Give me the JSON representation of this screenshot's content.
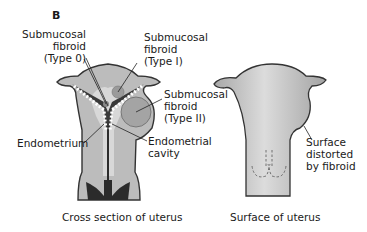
{
  "panel_label": "B",
  "left_figure": {
    "caption": "Cross section of uterus",
    "labels": {
      "type0": "Submucosal\nfibroid\n(Type 0)",
      "type1": "Submucosal\nfibroid\n(Type I)",
      "type2": "Submucosal\nfibroid\n(Type II)",
      "endometrium": "Endometrium",
      "cavity": "Endometrial\ncavity"
    }
  },
  "right_figure": {
    "caption": "Surface of uterus",
    "labels": {
      "distorted": "Surface\ndistorted\nby fibroid"
    }
  },
  "colors": {
    "wall": "#b9b9b9",
    "wall_light": "#d9d9d9",
    "outline": "#333333",
    "dark": "#2b2b2b",
    "fibroid": "#a0a0a0"
  }
}
